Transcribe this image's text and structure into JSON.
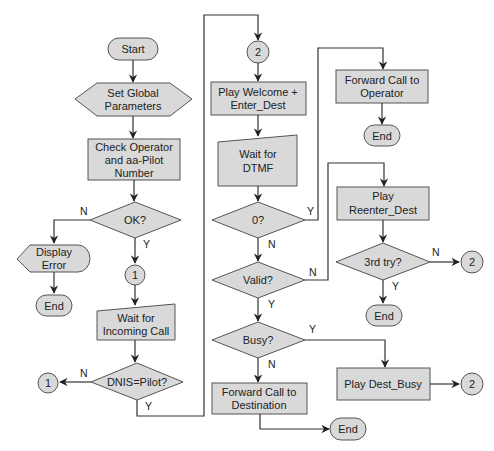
{
  "nodes": {
    "start": "Start",
    "set_global_1": "Set Global",
    "set_global_2": "Parameters",
    "check_op_1": "Check Operator",
    "check_op_2": "and aa-Pilot",
    "check_op_3": "Number",
    "ok": "OK?",
    "display_error_1": "Display",
    "display_error_2": "Error",
    "end_error": "End",
    "conn1_a": "1",
    "wait_call_1": "Wait for",
    "wait_call_2": "Incoming Call",
    "dnis": "DNIS=Pilot?",
    "conn1_b": "1",
    "conn2_a": "2",
    "play_welcome_1": "Play Welcome +",
    "play_welcome_2": "Enter_Dest",
    "wait_dtmf_1": "Wait for",
    "wait_dtmf_2": "DTMF",
    "zero": "0?",
    "valid": "Valid?",
    "busy": "Busy?",
    "fwd_dest_1": "Forward Call to",
    "fwd_dest_2": "Destination",
    "end_dest": "End",
    "fwd_op_1": "Forward Call to",
    "fwd_op_2": "Operator",
    "end_op": "End",
    "reenter_1": "Play",
    "reenter_2": "Reenter_Dest",
    "third_try": "3rd try?",
    "conn2_b": "2",
    "end_retry": "End",
    "dest_busy": "Play Dest_Busy",
    "conn2_c": "2"
  },
  "edge_labels": {
    "ok_n": "N",
    "ok_y": "Y",
    "dnis_n": "N",
    "dnis_y": "Y",
    "zero_y": "Y",
    "zero_n": "N",
    "valid_n": "N",
    "valid_y": "Y",
    "busy_y": "Y",
    "busy_n": "N",
    "third_n": "N",
    "third_y": "Y"
  },
  "colors": {
    "fill": "#d9d9d9",
    "stroke": "#555555",
    "line": "#333333"
  }
}
